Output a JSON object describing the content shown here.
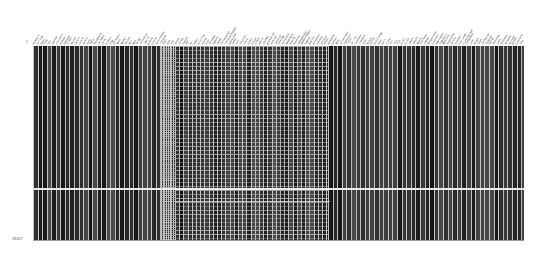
{
  "canvas": {
    "width": 553,
    "height": 262,
    "background": "#ffffff"
  },
  "corner_label": {
    "text": "18207",
    "x": 12,
    "y": 238
  },
  "left_tick": {
    "text": "1",
    "x": 26,
    "y": 41
  },
  "grid": {
    "left": 33,
    "top": 46,
    "width": 491,
    "height": 194,
    "column_line_color": "#c9c9c9",
    "row_line_color": "#b8b8b8",
    "base_rule_color": "#9a9a9a"
  },
  "highlight_row": {
    "y": 188,
    "color": "#f2f2f2",
    "label": "selected-row"
  },
  "secondary_highlight_row": {
    "y": 201,
    "x": 175,
    "width": 155,
    "color": "#dedede"
  },
  "blocks": [
    {
      "name": "left-block",
      "x": 0,
      "width": 128,
      "height": 194,
      "fill": "#2b2b2b",
      "mesh": false,
      "col_width": 4.55,
      "row_height": 0
    },
    {
      "name": "divider-band",
      "x": 128,
      "width": 14,
      "height": 194,
      "fill": "#d8d8d8",
      "mesh": false,
      "col_width": 1.7,
      "row_height": 2.1
    },
    {
      "name": "middle-block",
      "x": 142,
      "width": 153,
      "height": 194,
      "fill": "#4a4a4a",
      "mesh": true,
      "col_width": 4.2,
      "row_height": 4.0
    },
    {
      "name": "right-block",
      "x": 295,
      "width": 196,
      "height": 194,
      "fill": "#3c3c3c",
      "mesh": false,
      "col_width": 4.6,
      "row_height": 0
    }
  ],
  "headers": {
    "rotation_deg": -58,
    "font_size_px": 2.6,
    "color": "#2e2e2e",
    "labels": [
      "Sample ID",
      "Run Date",
      "Batch",
      "Plate",
      "Well",
      "Operator",
      "Instrument",
      "Protocol",
      "Replicate",
      "Dilution",
      "Volume",
      "Conc A",
      "Conc B",
      "Conc C",
      "Ratio",
      "Signal",
      "Background",
      "Net Signal",
      "CV %",
      "Z Score",
      "Flag",
      "QC Status",
      "Mean",
      "Median",
      "Std Dev",
      "Min",
      "Max",
      "Range",
      "Norm Value",
      "Log2 FC",
      "p Value",
      "q Value",
      "Gene Symbol",
      "Transcript",
      "Exon",
      "Start",
      "End",
      "Strand",
      "Chrom",
      "Position",
      "Ref",
      "Alt",
      "Depth",
      "Allele Freq",
      "Quality",
      "Filter",
      "Genotype",
      "Zygosity",
      "Impact",
      "Consequence",
      "Transcript Biotype",
      "Amino Acid",
      "Codon",
      "SIFT",
      "PolyPhen",
      "CADD",
      "GERP",
      "PhyloP",
      "ClinVar",
      "dbSNP",
      "COSMIC",
      "gnomAD AF",
      "ExAC AF",
      "1000G AF",
      "Coverage",
      "Strand Bias",
      "Mapping Q",
      "Base Q",
      "Read Pos",
      "Homopolymer",
      "Repeat Region",
      "Segdup",
      "Blacklist",
      "Annotation",
      "Pathway",
      "GO Term",
      "KEGG",
      "Reactome",
      "Domain",
      "Motif",
      "Conservation",
      "Expression",
      "Tissue",
      "Cell Line",
      "Treatment",
      "Timepoint",
      "Dose",
      "Vehicle",
      "Control",
      "Fold Change",
      "Adj p",
      "Rank",
      "Cluster",
      "PC1",
      "PC2",
      "PC3",
      "tSNE1",
      "tSNE2",
      "UMAP1",
      "UMAP2",
      "Module",
      "Hub Score",
      "Degree",
      "Betweenness",
      "Closeness",
      "Eigenvector",
      "PageRank",
      "Modularity",
      "Assortativity",
      "Density",
      "Diameter",
      "Path Length",
      "Clustering Coef",
      "Component",
      "Label",
      "Weight",
      "Score",
      "Confidence",
      "Evidence",
      "Source",
      "Reference",
      "Notes",
      "Reviewed",
      "Validated",
      "Archived",
      "Version",
      "Checksum",
      "Size"
    ]
  }
}
